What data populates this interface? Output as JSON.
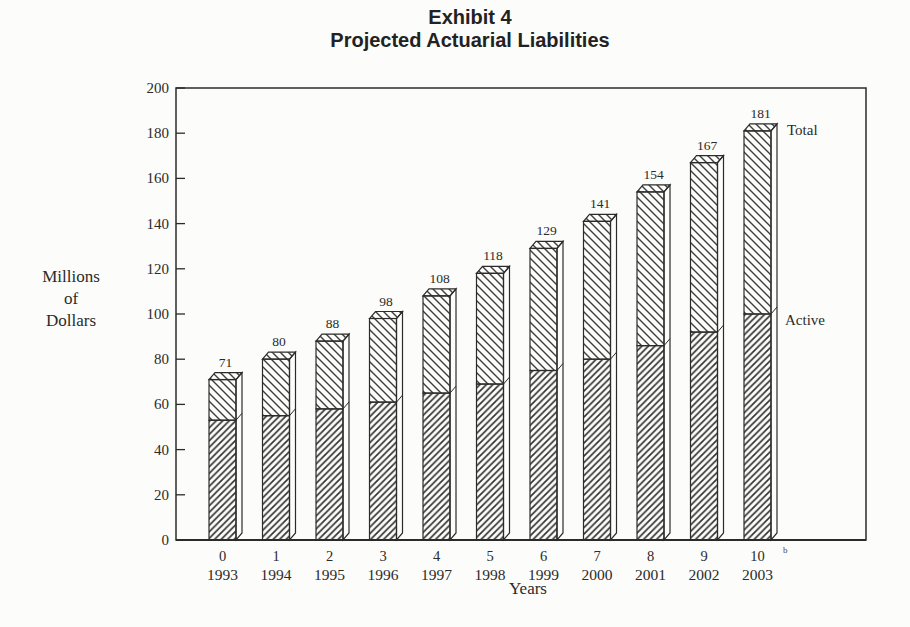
{
  "paper_color": "#fcfcfa",
  "ink_color": "#2b2b2b",
  "title": {
    "line1": "Exhibit 4",
    "line2": "Projected Actuarial Liabilities"
  },
  "chart_data": {
    "type": "bar",
    "stacked": true,
    "xlabel": "Years",
    "ylabel": "Millions of Dollars",
    "ylabel_lines": [
      "Millions",
      "of",
      "Dollars"
    ],
    "ylim": [
      0,
      200
    ],
    "yticks": [
      0,
      20,
      40,
      60,
      80,
      100,
      120,
      140,
      160,
      180,
      200
    ],
    "grid": false,
    "legend_position": "annotations-right-of-last-bar",
    "x_year_index": [
      "0",
      "1",
      "2",
      "3",
      "4",
      "5",
      "6",
      "7",
      "8",
      "9",
      "10"
    ],
    "x_calendar_year": [
      "1993",
      "1994",
      "1995",
      "1996",
      "1997",
      "1998",
      "1999",
      "2000",
      "2001",
      "2002",
      "2003"
    ],
    "series": [
      {
        "name": "Active",
        "hatch": "/",
        "values": [
          53,
          55,
          58,
          61,
          65,
          69,
          75,
          80,
          86,
          92,
          100
        ]
      },
      {
        "name": "Total",
        "hatch": "\\",
        "values": [
          71,
          80,
          88,
          98,
          108,
          118,
          129,
          141,
          154,
          167,
          181
        ]
      }
    ],
    "bar_value_labels": [
      "71",
      "80",
      "88",
      "98",
      "108",
      "118",
      "129",
      "141",
      "154",
      "167",
      "181"
    ],
    "annotation_total": "Total",
    "annotation_active": "Active",
    "footnote_marker": "b"
  }
}
